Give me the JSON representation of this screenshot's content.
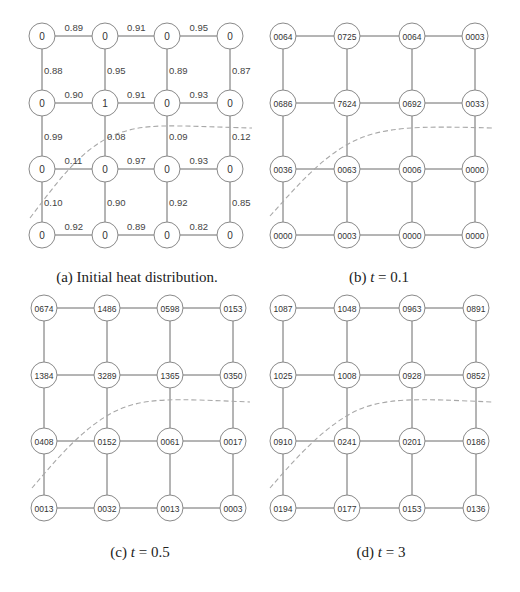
{
  "figure": {
    "panels": [
      {
        "id": "a",
        "caption": "(a) Initial heat distribution.",
        "caption_parts": {
          "prefix": "(a) Initial heat distribution.",
          "var": "",
          "rest": ""
        },
        "node_values": [
          [
            "0",
            "0",
            "0",
            "0"
          ],
          [
            "0",
            "1",
            "0",
            "0"
          ],
          [
            "0",
            "0",
            "0",
            "0"
          ],
          [
            "0",
            "0",
            "0",
            "0"
          ]
        ],
        "horizontal_weights": [
          [
            "0.89",
            "0.91",
            "0.95"
          ],
          [
            "0.90",
            "0.91",
            "0.93"
          ],
          [
            "0.11",
            "0.97",
            "0.93"
          ],
          [
            "0.92",
            "0.89",
            "0.82"
          ]
        ],
        "vertical_weights": [
          [
            "0.88",
            "0.95",
            "0.89",
            "0.87"
          ],
          [
            "0.99",
            "0.08",
            "0.09",
            "0.12"
          ],
          [
            "0.10",
            "0.90",
            "0.92",
            "0.85"
          ]
        ]
      },
      {
        "id": "b",
        "caption": "(b) t = 0.1",
        "caption_parts": {
          "prefix": "(b) ",
          "var": "t",
          "rest": " = 0.1"
        },
        "node_values": [
          [
            "0064",
            "0725",
            "0064",
            "0003"
          ],
          [
            "0686",
            "7624",
            "0692",
            "0033"
          ],
          [
            "0036",
            "0063",
            "0006",
            "0000"
          ],
          [
            "0000",
            "0003",
            "0000",
            "0000"
          ]
        ]
      },
      {
        "id": "c",
        "caption": "(c) t = 0.5",
        "caption_parts": {
          "prefix": "(c) ",
          "var": "t",
          "rest": " = 0.5"
        },
        "node_values": [
          [
            "0674",
            "1486",
            "0598",
            "0153"
          ],
          [
            "1384",
            "3289",
            "1365",
            "0350"
          ],
          [
            "0408",
            "0152",
            "0061",
            "0017"
          ],
          [
            "0013",
            "0032",
            "0013",
            "0003"
          ]
        ]
      },
      {
        "id": "d",
        "caption": "(d) t = 3",
        "caption_parts": {
          "prefix": "(d) ",
          "var": "t",
          "rest": " = 3"
        },
        "node_values": [
          [
            "1087",
            "1048",
            "0963",
            "0891"
          ],
          [
            "1025",
            "1008",
            "0928",
            "0852"
          ],
          [
            "0910",
            "0241",
            "0201",
            "0186"
          ],
          [
            "0194",
            "0177",
            "0153",
            "0136"
          ]
        ]
      }
    ],
    "colors": {
      "edge": "#6a6a6a",
      "node_stroke": "#8a8a8a",
      "boundary_dashed": "#a8a8a8",
      "text": "#333333"
    }
  }
}
